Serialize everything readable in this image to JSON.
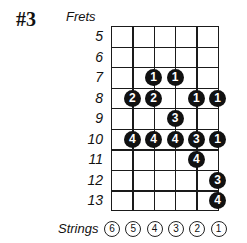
{
  "diagram": {
    "title": "#3",
    "frets_label": "Frets",
    "strings_label": "Strings",
    "frets": [
      "5",
      "6",
      "7",
      "8",
      "9",
      "10",
      "11",
      "12",
      "13"
    ],
    "strings": [
      "6",
      "5",
      "4",
      "3",
      "2",
      "1"
    ],
    "dot_color": "#111111",
    "dot_text_color": "#ffffff",
    "notes": [
      {
        "fret": "7",
        "string": "4",
        "finger": "1"
      },
      {
        "fret": "7",
        "string": "3",
        "finger": "1"
      },
      {
        "fret": "8",
        "string": "5",
        "finger": "2"
      },
      {
        "fret": "8",
        "string": "4",
        "finger": "2"
      },
      {
        "fret": "8",
        "string": "2",
        "finger": "1"
      },
      {
        "fret": "8",
        "string": "1",
        "finger": "1"
      },
      {
        "fret": "9",
        "string": "3",
        "finger": "3"
      },
      {
        "fret": "10",
        "string": "5",
        "finger": "4"
      },
      {
        "fret": "10",
        "string": "4",
        "finger": "4"
      },
      {
        "fret": "10",
        "string": "3",
        "finger": "4"
      },
      {
        "fret": "10",
        "string": "2",
        "finger": "3"
      },
      {
        "fret": "10",
        "string": "1",
        "finger": "1"
      },
      {
        "fret": "11",
        "string": "2",
        "finger": "4"
      },
      {
        "fret": "12",
        "string": "1",
        "finger": "3"
      },
      {
        "fret": "13",
        "string": "1",
        "finger": "4"
      }
    ]
  }
}
